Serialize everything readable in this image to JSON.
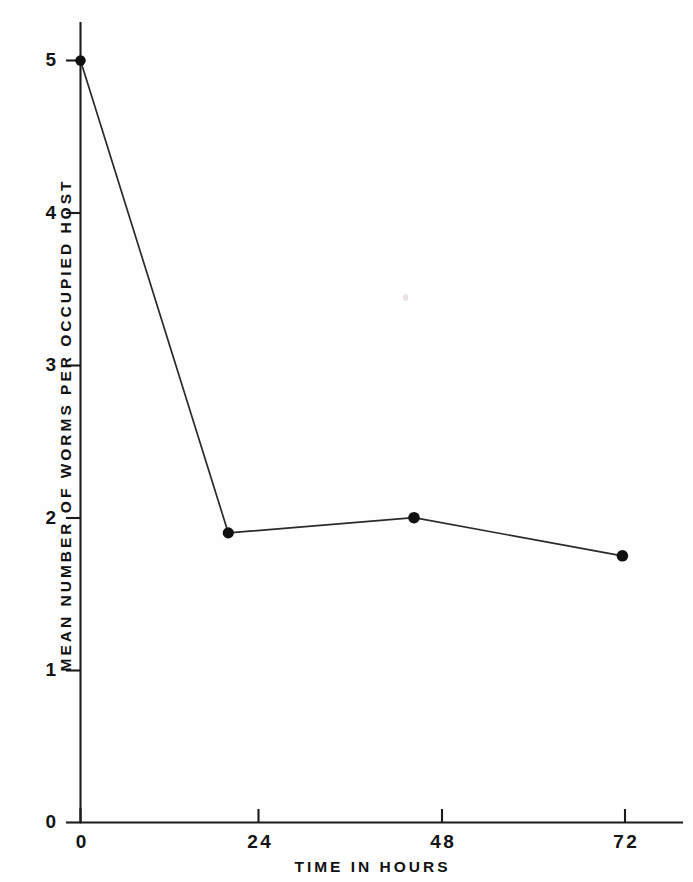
{
  "figure": {
    "background_color": "#fefefe",
    "ink_color": "#111111"
  },
  "chart_data": {
    "type": "line",
    "title": "",
    "xlabel": "TIME IN HOURS",
    "ylabel": "MEAN NUMBER OF WORMS PER OCCUPIED HOST",
    "x": [
      0,
      19.5,
      44,
      71.5
    ],
    "values": [
      5.0,
      1.9,
      2.0,
      1.75
    ],
    "series": [
      {
        "name": "mean worms per occupied host",
        "x": [
          0,
          19.5,
          44,
          71.5
        ],
        "values": [
          5.0,
          1.9,
          2.0,
          1.75
        ],
        "marker": "filled-circle",
        "line_color": "#222222",
        "marker_color": "#111111"
      }
    ],
    "xlim": [
      0,
      79.5
    ],
    "ylim": [
      0,
      5.25
    ],
    "xticks": [
      0,
      24,
      48,
      72
    ],
    "xtick_labels": [
      "0",
      "24",
      "48",
      "72"
    ],
    "yticks": [
      0,
      1,
      2,
      3,
      4,
      5
    ],
    "ytick_labels": [
      "0",
      "1",
      "2",
      "3",
      "4",
      "5"
    ],
    "grid": false,
    "legend": false,
    "legend_position": "none"
  },
  "axes": {
    "y_title": "MEAN NUMBER OF WORMS PER OCCUPIED HOST",
    "x_title": "TIME IN HOURS",
    "y_tick_labels": [
      "5",
      "4",
      "3",
      "2",
      "1",
      "0"
    ],
    "x_tick_labels": [
      "0",
      "24",
      "48",
      "72"
    ]
  }
}
